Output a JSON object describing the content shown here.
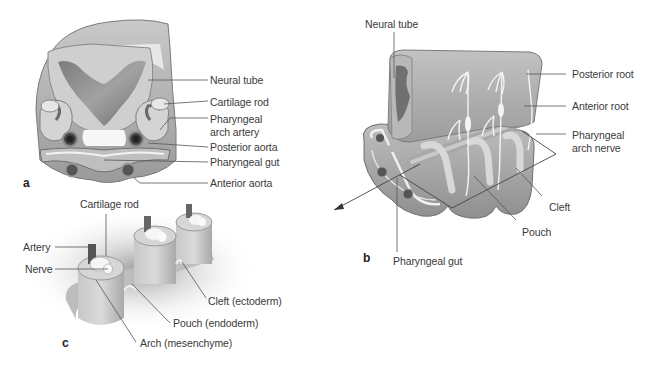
{
  "figure": {
    "type": "anatomical-illustration",
    "topic": "Pharyngeal arches",
    "colors": {
      "tissue_light": "#d8d8d8",
      "tissue_mid": "#b9b9b9",
      "tissue_dark": "#8e8e8e",
      "cavity": "#a6a6a6",
      "cartilage": "#f2f2f2",
      "leader_line": "#555555",
      "text": "#3a3a3a"
    },
    "panels": [
      {
        "id": "a",
        "letter": "a",
        "view": "cross-section",
        "labels": [
          "Neural tube",
          "Cartilage rod",
          "Pharyngeal",
          "arch artery",
          "Posterior aorta",
          "Pharyngeal gut",
          "Anterior aorta"
        ]
      },
      {
        "id": "b",
        "letter": "b",
        "view": "oblique 3D",
        "labels": [
          "Neural tube",
          "Posterior root",
          "Anterior root",
          "Pharyngeal",
          "arch nerve",
          "Cleft",
          "Pouch",
          "Pharyngeal gut"
        ]
      },
      {
        "id": "c",
        "letter": "c",
        "view": "arch detail",
        "labels": [
          "Cartilage rod",
          "Artery",
          "Nerve",
          "Cleft (ectoderm)",
          "Pouch (endoderm)",
          "Arch (mesenchyme)"
        ]
      }
    ]
  }
}
